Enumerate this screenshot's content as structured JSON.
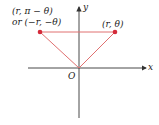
{
  "diagram": {
    "labels": {
      "left_point_line1": "(r, π − θ)",
      "left_point_line2": "or (−r, −θ)",
      "right_point": "(r, θ)",
      "origin": "O",
      "x_axis": "x",
      "y_axis": "y"
    },
    "colors": {
      "axis": "#333333",
      "triangle": "#e07070",
      "point": "#d42a3a"
    },
    "points": {
      "left": {
        "x": 40,
        "y": 32
      },
      "right": {
        "x": 115,
        "y": 32
      },
      "origin": {
        "x": 79,
        "y": 68
      }
    }
  }
}
